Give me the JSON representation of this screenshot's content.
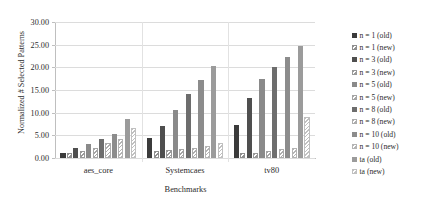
{
  "chart_data": {
    "type": "bar",
    "title": "",
    "xlabel": "Benchmarks",
    "ylabel": "Normalized # Selected Patterns",
    "categories": [
      "aes_core",
      "Systemcaes",
      "tv80"
    ],
    "ylim": [
      0,
      30
    ],
    "ytick_labels": [
      "0.00",
      "5.00",
      "10.00",
      "15.00",
      "20.00",
      "25.00",
      "30.00"
    ],
    "ytick_values": [
      0,
      5,
      10,
      15,
      20,
      25,
      30
    ],
    "grid": true,
    "legend_position": "right",
    "series": [
      {
        "name": "n = 1 (old)",
        "pattern": "solid",
        "color": "#3b3b3b",
        "values": [
          1.0,
          4.4,
          7.3
        ]
      },
      {
        "name": "n = 1 (new)",
        "pattern": "hatch",
        "color": "#8f8f8f",
        "values": [
          1.0,
          1.5,
          1.0
        ]
      },
      {
        "name": "n = 3 (old)",
        "pattern": "solid",
        "color": "#4f4f4f",
        "values": [
          2.1,
          7.0,
          13.3
        ]
      },
      {
        "name": "n = 3 (new)",
        "pattern": "hatch",
        "color": "#9a9a9a",
        "values": [
          1.6,
          1.7,
          1.2
        ]
      },
      {
        "name": "n = 5 (old)",
        "pattern": "solid",
        "color": "#8a8a8a",
        "values": [
          3.0,
          10.5,
          17.5
        ]
      },
      {
        "name": "n = 5 (new)",
        "pattern": "hatch",
        "color": "#a5a5a5",
        "values": [
          2.3,
          2.0,
          1.5
        ]
      },
      {
        "name": "n = 8 (old)",
        "pattern": "solid",
        "color": "#6d6d6d",
        "values": [
          4.3,
          14.2,
          20.1
        ]
      },
      {
        "name": "n = 8 (new)",
        "pattern": "hatch",
        "color": "#adadad",
        "values": [
          3.3,
          2.3,
          1.9
        ]
      },
      {
        "name": "n = 10 (old)",
        "pattern": "solid",
        "color": "#8c8c8c",
        "values": [
          5.4,
          17.1,
          22.3
        ]
      },
      {
        "name": "n = 10 (new)",
        "pattern": "hatch",
        "color": "#b4b4b4",
        "values": [
          4.3,
          2.6,
          2.3
        ]
      },
      {
        "name": "ta (old)",
        "pattern": "solid",
        "color": "#9b9b9b",
        "values": [
          8.5,
          20.2,
          24.8
        ]
      },
      {
        "name": "ta (new)",
        "pattern": "hatch",
        "color": "#c0c0c0",
        "values": [
          6.7,
          3.4,
          9.0
        ]
      }
    ]
  },
  "axis": {
    "ylabel": "Normalized # Selected Patterns",
    "xlabel": "Benchmarks"
  }
}
